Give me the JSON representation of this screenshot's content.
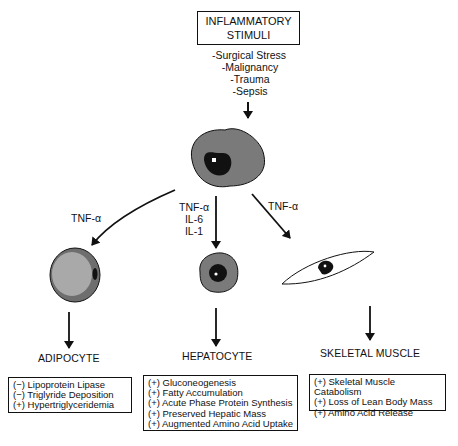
{
  "title": {
    "line1": "INFLAMMATORY",
    "line2": "STIMULI"
  },
  "stimuli": [
    "-Surgical Stress",
    "-Malignancy",
    "-Trauma",
    "-Sepsis"
  ],
  "mediators": {
    "left": "TNF-α",
    "center": [
      "TNF-α",
      "IL-6",
      "IL-1"
    ],
    "right": "TNF-α"
  },
  "targets": [
    {
      "label": "ADIPOCYTE",
      "effects": [
        "(−) Lipoprotein Lipase",
        "(−) Triglyride Deposition",
        "(+) Hypertriglyceridemia"
      ]
    },
    {
      "label": "HEPATOCYTE",
      "effects": [
        "(+) Gluconeogenesis",
        "(+) Fatty Accumulation",
        "(+) Acute Phase Protein Synthesis",
        "(+) Preserved Hepatic Mass",
        "(+) Augmented Amino Acid Uptake"
      ]
    },
    {
      "label": "SKELETAL MUSCLE",
      "effects": [
        "(+) Skeletal Muscle Catabolism",
        "(+) Loss of Lean Body Mass",
        "(+) Amino Acid Release"
      ]
    }
  ],
  "colors": {
    "cytoplasm": "#7a7a7a",
    "adipocyte_fat": "#a9a9a9",
    "nucleus": "#111111",
    "line": "#111111"
  }
}
